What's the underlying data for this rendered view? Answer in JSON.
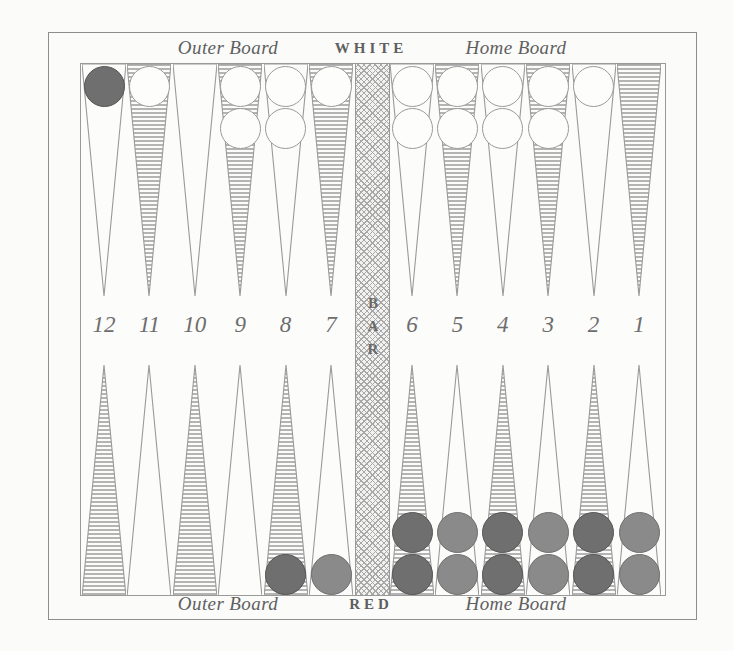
{
  "diagram": {
    "bar_label": "BAR"
  },
  "labels": {
    "top": {
      "outer_board": "Outer Board",
      "player": "WHITE",
      "home_board": "Home Board"
    },
    "bottom": {
      "outer_board": "Outer Board",
      "player": "RED",
      "home_board": "Home Board"
    }
  },
  "colors": {
    "ink": "#5f5f5f",
    "rule": "#9a9a9a",
    "paper": "#fbfbfa",
    "shade": "#b4b4b4",
    "white_checker": "#fdfdfc",
    "red_checker": "#8a8a8a",
    "red_checker_dark": "#6f6f6f"
  },
  "point_numbers": [
    "12",
    "11",
    "10",
    "9",
    "8",
    "7",
    "6",
    "5",
    "4",
    "3",
    "2",
    "1"
  ],
  "points": [
    {
      "number": "12",
      "column": 0,
      "top_shaded": false,
      "bottom_shaded": true,
      "top_checkers": {
        "color": "red",
        "count": 1
      },
      "bottom_checkers": {
        "color": "red",
        "count": 0
      }
    },
    {
      "number": "11",
      "column": 1,
      "top_shaded": true,
      "bottom_shaded": false,
      "top_checkers": {
        "color": "white",
        "count": 1
      },
      "bottom_checkers": {
        "color": "red",
        "count": 0
      }
    },
    {
      "number": "10",
      "column": 2,
      "top_shaded": false,
      "bottom_shaded": true,
      "top_checkers": {
        "color": "white",
        "count": 0
      },
      "bottom_checkers": {
        "color": "red",
        "count": 0
      }
    },
    {
      "number": "9",
      "column": 3,
      "top_shaded": true,
      "bottom_shaded": false,
      "top_checkers": {
        "color": "white",
        "count": 2
      },
      "bottom_checkers": {
        "color": "red",
        "count": 0
      }
    },
    {
      "number": "8",
      "column": 4,
      "top_shaded": false,
      "bottom_shaded": true,
      "top_checkers": {
        "color": "white",
        "count": 2
      },
      "bottom_checkers": {
        "color": "red",
        "count": 1
      }
    },
    {
      "number": "7",
      "column": 5,
      "top_shaded": true,
      "bottom_shaded": false,
      "top_checkers": {
        "color": "white",
        "count": 1
      },
      "bottom_checkers": {
        "color": "red",
        "count": 1
      }
    },
    {
      "number": "6",
      "column": 6,
      "top_shaded": false,
      "bottom_shaded": true,
      "top_checkers": {
        "color": "white",
        "count": 2
      },
      "bottom_checkers": {
        "color": "red",
        "count": 2
      }
    },
    {
      "number": "5",
      "column": 7,
      "top_shaded": true,
      "bottom_shaded": false,
      "top_checkers": {
        "color": "white",
        "count": 2
      },
      "bottom_checkers": {
        "color": "red",
        "count": 2
      }
    },
    {
      "number": "4",
      "column": 8,
      "top_shaded": false,
      "bottom_shaded": true,
      "top_checkers": {
        "color": "white",
        "count": 2
      },
      "bottom_checkers": {
        "color": "red",
        "count": 2
      }
    },
    {
      "number": "3",
      "column": 9,
      "top_shaded": true,
      "bottom_shaded": false,
      "top_checkers": {
        "color": "white",
        "count": 2
      },
      "bottom_checkers": {
        "color": "red",
        "count": 2
      }
    },
    {
      "number": "2",
      "column": 10,
      "top_shaded": false,
      "bottom_shaded": true,
      "top_checkers": {
        "color": "white",
        "count": 1
      },
      "bottom_checkers": {
        "color": "red",
        "count": 2
      }
    },
    {
      "number": "1",
      "column": 11,
      "top_shaded": true,
      "bottom_shaded": false,
      "top_checkers": {
        "color": "white",
        "count": 0
      },
      "bottom_checkers": {
        "color": "red",
        "count": 2
      }
    }
  ]
}
